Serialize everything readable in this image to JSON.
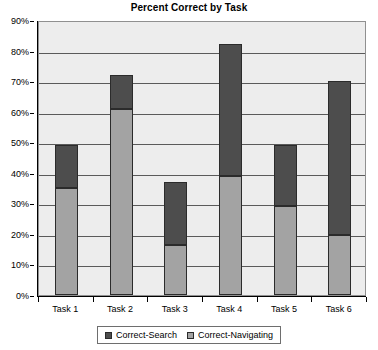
{
  "chart_data": {
    "type": "bar",
    "subtype": "stacked-column",
    "title": "Percent Correct by Task",
    "xlabel": "",
    "ylabel": "",
    "categories": [
      "Task 1",
      "Task 2",
      "Task 3",
      "Task 4",
      "Task 5",
      "Task 6"
    ],
    "series": [
      {
        "name": "Correct-Navigating",
        "color": "#a3a3a3",
        "values": [
          35,
          61,
          16.5,
          39,
          29,
          19.5
        ]
      },
      {
        "name": "Correct-Search",
        "color": "#4d4d4d",
        "values": [
          14,
          11,
          20.5,
          43,
          20,
          50.5
        ]
      }
    ],
    "totals": [
      49,
      72,
      37,
      82,
      49,
      70
    ],
    "ylim": [
      0,
      90
    ],
    "y_ticks": [
      0,
      10,
      20,
      30,
      40,
      50,
      60,
      70,
      80,
      90
    ],
    "y_tick_labels": [
      "0%",
      "10%",
      "20%",
      "30%",
      "40%",
      "50%",
      "60%",
      "70%",
      "80%",
      "90%"
    ],
    "grid": true,
    "legend_position": "bottom",
    "plot_background": "#ededed"
  },
  "legend": {
    "entries": [
      {
        "label": "Correct-Search",
        "color": "#4d4d4d"
      },
      {
        "label": "Correct-Navigating",
        "color": "#a3a3a3"
      }
    ]
  }
}
